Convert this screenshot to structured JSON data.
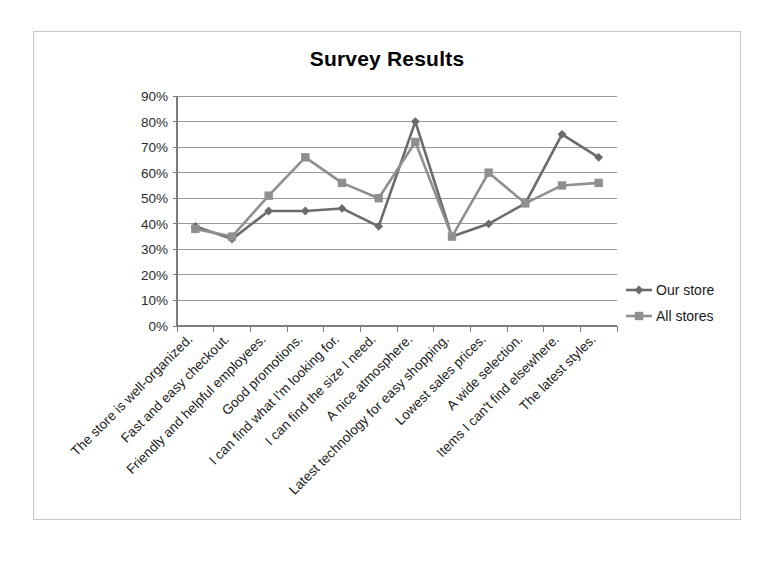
{
  "chart_data": {
    "type": "line",
    "title": "Survey Results",
    "xlabel": "",
    "ylabel": "",
    "ylim": [
      0,
      90
    ],
    "ytick_labels": [
      "0%",
      "10%",
      "20%",
      "30%",
      "40%",
      "50%",
      "60%",
      "70%",
      "80%",
      "90%"
    ],
    "ytick_values": [
      0,
      10,
      20,
      30,
      40,
      50,
      60,
      70,
      80,
      90
    ],
    "grid": true,
    "legend_position": "right",
    "categories": [
      "The store is well-organized.",
      "Fast and easy checkout.",
      "Friendly and helpful employees.",
      "Good promotions.",
      "I can find what I'm looking for.",
      "I can find the size I need.",
      "A nice atmosphere.",
      "Latest technology for easy shopping.",
      "Lowest sales prices.",
      "A wide selection.",
      "Items I can't find elsewhere.",
      "The latest styles."
    ],
    "series": [
      {
        "name": "Our store",
        "marker": "diamond",
        "color": "#6b6b6b",
        "values": [
          39,
          34,
          45,
          45,
          46,
          39,
          80,
          35,
          40,
          48,
          75,
          66
        ]
      },
      {
        "name": "All stores",
        "marker": "square",
        "color": "#8f8f8f",
        "values": [
          38,
          35,
          51,
          66,
          56,
          50,
          72,
          35,
          60,
          48,
          55,
          56
        ]
      }
    ]
  },
  "legend": {
    "entries": [
      {
        "label": "Our store"
      },
      {
        "label": "All stores"
      }
    ]
  },
  "colors": {
    "series_our_store": "#6b6b6b",
    "series_all_stores": "#8f8f8f",
    "gridline": "#9a9a9a",
    "frame_border": "#c8c8c8",
    "text": "#000000"
  }
}
